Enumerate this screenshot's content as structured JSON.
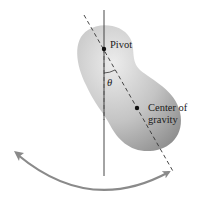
{
  "diagram": {
    "labels": {
      "pivot": "Pivot",
      "theta": "θ",
      "cog_line1": "Center of",
      "cog_line2": "gravity"
    },
    "colors": {
      "body_light": "#e6e6e6",
      "body_dark": "#8f8f8f",
      "line": "#333333",
      "arrow": "#8a8a8a",
      "text": "#1a1a1a"
    },
    "points": {
      "pivot": [
        104,
        49
      ],
      "center_of_gravity": [
        137,
        108
      ]
    }
  }
}
